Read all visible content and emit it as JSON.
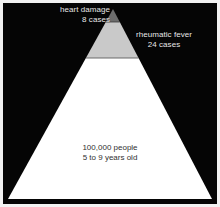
{
  "figure": {
    "name": "rheumatic-fever-population-pyramid",
    "background_color": "#050505",
    "border_color": "#f2f2f2"
  },
  "chart_data": {
    "type": "pie",
    "title": "",
    "subtitle": "",
    "xlabel": "",
    "ylabel": "",
    "legend_position": "inline-annotations",
    "grid": false,
    "shape": "triangle",
    "categories": [
      "100,000 people 5 to 9 years old",
      "rheumatic fever",
      "heart damage"
    ],
    "values": [
      100000,
      24,
      8
    ],
    "units": [
      "people",
      "cases",
      "cases"
    ],
    "tiers": [
      {
        "id": "apex",
        "label": "heart damage",
        "value_label": "8 cases",
        "value": 8,
        "unit": "cases",
        "color": "#6d6d6d",
        "y_top": 6,
        "y_bottom": 19
      },
      {
        "id": "middle",
        "label": "rheumatic fever",
        "value_label": "24 cases",
        "value": 24,
        "unit": "cases",
        "color": "#c9c9c9",
        "y_top": 19,
        "y_bottom": 55
      },
      {
        "id": "base",
        "label": "100,000 people",
        "value_label": "5 to 9 years old",
        "value": 100000,
        "unit": "people",
        "color": "#ffffff",
        "y_top": 55,
        "y_bottom": 196
      }
    ],
    "geometry": {
      "apex_x": 110,
      "apex_y": 6,
      "base_left_x": 5,
      "base_right_x": 209,
      "base_y": 196
    }
  },
  "labels": {
    "heart_damage": {
      "line1": "heart damage",
      "line2": "8 cases",
      "color": "#e8e8e8"
    },
    "rheumatic_fever": {
      "line1": "rheumatic fever",
      "line2": "24 cases",
      "color": "#e8e8e8"
    },
    "base_population": {
      "line1": "100,000 people",
      "line2": "5 to 9 years old",
      "color": "#303030"
    }
  }
}
